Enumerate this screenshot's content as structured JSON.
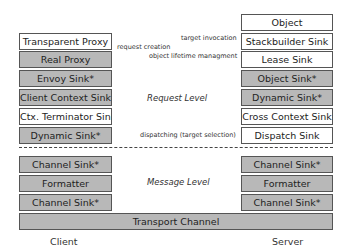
{
  "client": {
    "label": "Client",
    "request_level": [
      {
        "label": "Transparent Proxy",
        "style": "white"
      },
      {
        "label": "Real Proxy",
        "style": "gray"
      },
      {
        "label": "Envoy Sink*",
        "style": "gray"
      },
      {
        "label": "Client Context Sink*",
        "style": "gray"
      },
      {
        "label": "Ctx. Terminator Sink",
        "style": "white"
      },
      {
        "label": "Dynamic Sink*",
        "style": "gray"
      }
    ],
    "message_level": [
      {
        "label": "Channel Sink*",
        "style": "gray"
      },
      {
        "label": "Formatter",
        "style": "gray"
      },
      {
        "label": "Channel Sink*",
        "style": "gray"
      }
    ]
  },
  "server": {
    "label": "Server",
    "request_level": [
      {
        "label": "Object",
        "style": "white"
      },
      {
        "label": "Stackbuilder Sink",
        "style": "white"
      },
      {
        "label": "Lease Sink",
        "style": "white"
      },
      {
        "label": "Object Sink*",
        "style": "gray"
      },
      {
        "label": "Dynamic Sink*",
        "style": "gray"
      },
      {
        "label": "Cross Context Sink",
        "style": "white"
      },
      {
        "label": "Dispatch Sink",
        "style": "white"
      }
    ],
    "message_level": [
      {
        "label": "Channel Sink*",
        "style": "gray"
      },
      {
        "label": "Formatter",
        "style": "gray"
      },
      {
        "label": "Channel Sink*",
        "style": "gray"
      }
    ]
  },
  "annotations": {
    "request_creation": "request creation",
    "target_invocation": "target invocation",
    "object_lifetime": "object lifetime managment",
    "dispatching": "dispatching (target selection)"
  },
  "levels": {
    "request": "Request Level",
    "message": "Message Level"
  },
  "transport": "Transport Channel",
  "colors": {
    "gray_box": "#b8b8b8",
    "white_box": "#ffffff",
    "border": "#555555"
  }
}
